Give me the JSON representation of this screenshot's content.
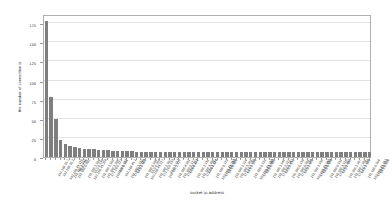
{
  "chart_data": {
    "type": "bar",
    "title": "",
    "xlabel": "socket ip address",
    "ylabel": "the number of connection is",
    "ylim": [
      0,
      187
    ],
    "ytick_values": [
      0,
      25,
      50,
      75,
      100,
      125,
      150,
      175
    ],
    "ytick_labels": [
      "0",
      "25",
      "50",
      "75",
      "100",
      "125",
      "150",
      "175"
    ],
    "grid": true,
    "legend": false,
    "bar_color": "#7f7f7f",
    "background_color": "#ffffff",
    "grid_color": "#e2e2e2",
    "axis_color": "#b0b0b0",
    "text_color": "#2b2b2b",
    "categories": [
      "192.168.20.7",
      "192.168.20.1",
      "192.168.43.110",
      "192.168.1.102",
      "192.168.0.102",
      "10.0.2.15",
      "192.168.1.104",
      "192.168.43.254",
      "10.0.0.138",
      "192.168.1.103",
      "192.168.1.105",
      "172.16.0.121",
      "192.168.0.101",
      "10.0.0.112",
      "192.168.43.1",
      "192.168.1.112",
      "172.16.1.114",
      "10.0.2.102",
      "192.168.0.105",
      "192.168.43.217",
      "10.0.0.104",
      "192.168.2.107",
      "172.16.0.133",
      "192.168.1.117",
      "10.0.1.121",
      "192.168.4.101",
      "192.168.0.117",
      "172.16.2.101",
      "10.0.0.171",
      "192.168.1.131",
      "192.168.3.108",
      "172.16.1.127",
      "10.0.2.118",
      "192.168.0.113",
      "192.168.43.233",
      "172.16.0.109",
      "10.0.0.160",
      "192.168.1.124",
      "192.168.5.101",
      "172.16.2.115",
      "10.0.1.138",
      "192.168.0.128",
      "192.168.43.119",
      "172.16.1.141",
      "10.0.0.183",
      "192.168.1.149",
      "192.168.2.122",
      "172.16.0.147",
      "10.0.2.131",
      "192.168.0.139",
      "192.168.6.101",
      "172.16.2.128",
      "10.0.1.152",
      "192.168.1.158",
      "192.168.43.142",
      "172.16.1.153",
      "10.0.0.194",
      "192.168.0.151",
      "192.168.3.126",
      "172.16.0.162",
      "10.0.2.147",
      "192.168.1.167",
      "192.168.7.101",
      "172.16.2.139",
      "10.0.1.168",
      "192.168.0.164",
      "192.168.43.157",
      "172.16.1.171",
      "10.0.0.208"
    ],
    "values": [
      178,
      78,
      50,
      22,
      17,
      15,
      13,
      12,
      11,
      10,
      10,
      9,
      9,
      9,
      8,
      8,
      8,
      8,
      8,
      7,
      7,
      7,
      7,
      7,
      7,
      7,
      7,
      7,
      7,
      7,
      7,
      7,
      7,
      7,
      7,
      7,
      7,
      7,
      7,
      7,
      7,
      7,
      7,
      7,
      7,
      7,
      7,
      7,
      7,
      7,
      7,
      7,
      7,
      7,
      7,
      7,
      7,
      7,
      7,
      7,
      7,
      7,
      7,
      7,
      7,
      7,
      7,
      7,
      6
    ]
  }
}
